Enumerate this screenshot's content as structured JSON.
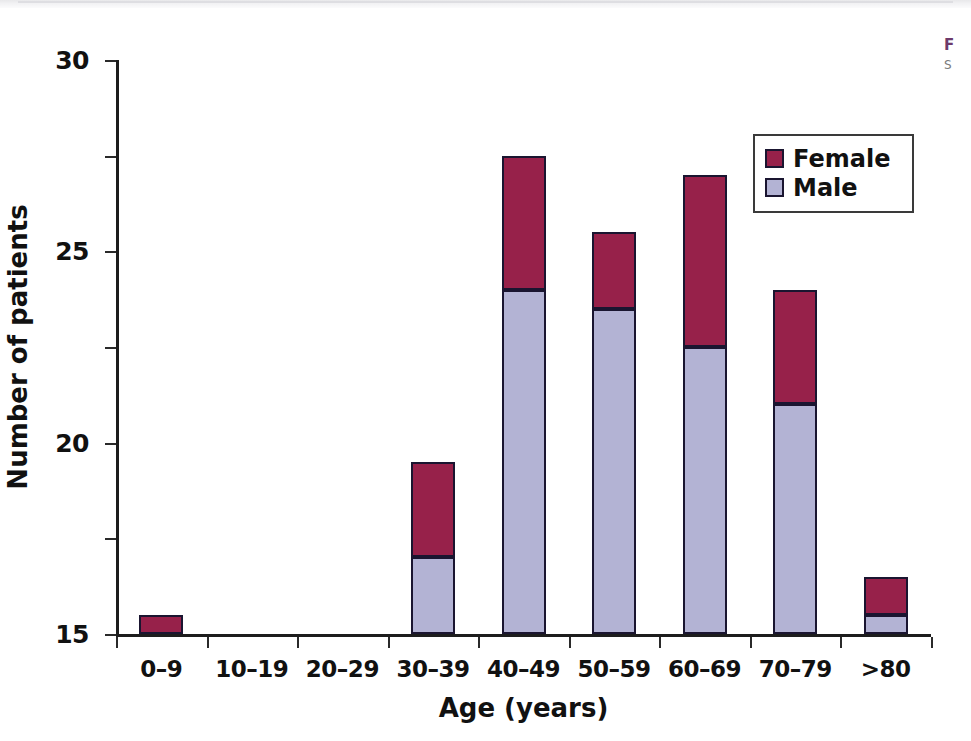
{
  "caption": {
    "figure_label": "F",
    "subtitle_fragment": "S"
  },
  "legend": {
    "position": "top-right",
    "items": [
      {
        "label": "Female",
        "color": "#97214A"
      },
      {
        "label": "Male",
        "color": "#B3B3D4"
      }
    ]
  },
  "colors": {
    "female": "#97214A",
    "male": "#B3B3D4",
    "bar_outline": "#1A1530",
    "axis": "#1D1D1D",
    "caption_accent": "#6D3A6B"
  },
  "chart_data": {
    "type": "bar",
    "stacked": true,
    "title": "",
    "xlabel": "Age (years)",
    "ylabel": "Number of patients",
    "categories": [
      "0–9",
      "10–19",
      "20–29",
      "30–39",
      "40–49",
      "50–59",
      "60–69",
      "70–79",
      ">80"
    ],
    "series": [
      {
        "name": "Male",
        "color": "#B3B3D4",
        "values": [
          0,
          0,
          0,
          4,
          18,
          17,
          15,
          12,
          1
        ]
      },
      {
        "name": "Female",
        "color": "#97214A",
        "values": [
          1,
          0,
          0,
          5,
          7,
          4,
          9,
          6,
          2
        ]
      }
    ],
    "totals": [
      1,
      0,
      0,
      9,
      25,
      21,
      24,
      18,
      3
    ],
    "ylim": [
      0,
      30
    ],
    "yticks": [
      0,
      5,
      10,
      15,
      20,
      25,
      30
    ],
    "ytick_labels": [
      "0",
      "5",
      "10",
      "15",
      "20",
      "25",
      "30"
    ],
    "grid": false,
    "legend_position": "upper right"
  }
}
